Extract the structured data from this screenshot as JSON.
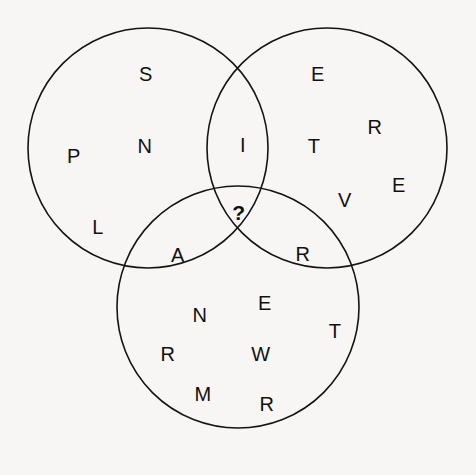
{
  "puzzle": {
    "type": "venn-diagram-letter-puzzle",
    "background_color": "#f7f6f4",
    "stroke_color": "#141414",
    "text_color": "#111111",
    "unknown_marker": "?",
    "circles": [
      {
        "id": "left",
        "name": "left-circle",
        "cx": 148,
        "cy": 148,
        "r": 120
      },
      {
        "id": "right",
        "name": "right-circle",
        "cx": 327,
        "cy": 148,
        "r": 120
      },
      {
        "id": "bottom",
        "name": "bottom-circle",
        "cx": 238,
        "cy": 307,
        "r": 121
      }
    ],
    "letters": [
      {
        "char": "S",
        "x": 146,
        "y": 74,
        "region": "left-only"
      },
      {
        "char": "P",
        "x": 74,
        "y": 156,
        "region": "left-only"
      },
      {
        "char": "N",
        "x": 145,
        "y": 146,
        "region": "left-only"
      },
      {
        "char": "L",
        "x": 98,
        "y": 227,
        "region": "left-only"
      },
      {
        "char": "I",
        "x": 243,
        "y": 145,
        "region": "left-right-overlap"
      },
      {
        "char": "E",
        "x": 318,
        "y": 74,
        "region": "right-only"
      },
      {
        "char": "R",
        "x": 375,
        "y": 127,
        "region": "right-only"
      },
      {
        "char": "T",
        "x": 314,
        "y": 146,
        "region": "right-only"
      },
      {
        "char": "E",
        "x": 399,
        "y": 185,
        "region": "right-only"
      },
      {
        "char": "V",
        "x": 345,
        "y": 200,
        "region": "right-only"
      },
      {
        "char": "?",
        "x": 239,
        "y": 212,
        "region": "center-triple-overlap"
      },
      {
        "char": "A",
        "x": 178,
        "y": 255,
        "region": "left-bottom-overlap"
      },
      {
        "char": "R",
        "x": 303,
        "y": 254,
        "region": "right-bottom-overlap"
      },
      {
        "char": "N",
        "x": 200,
        "y": 315,
        "region": "bottom-only"
      },
      {
        "char": "E",
        "x": 265,
        "y": 303,
        "region": "bottom-only"
      },
      {
        "char": "R",
        "x": 168,
        "y": 354,
        "region": "bottom-only"
      },
      {
        "char": "W",
        "x": 261,
        "y": 354,
        "region": "bottom-only"
      },
      {
        "char": "T",
        "x": 335,
        "y": 331,
        "region": "bottom-only"
      },
      {
        "char": "M",
        "x": 203,
        "y": 394,
        "region": "bottom-only"
      },
      {
        "char": "R",
        "x": 267,
        "y": 404,
        "region": "bottom-only"
      }
    ]
  }
}
